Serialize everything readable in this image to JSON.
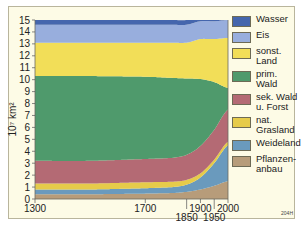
{
  "chart_data": {
    "type": "area",
    "stacked": true,
    "title": "",
    "xlabel": "",
    "ylabel": "10⁷ km²",
    "ylim": [
      0,
      15
    ],
    "xlim": [
      1300,
      2000
    ],
    "yticks": [
      "0",
      "1",
      "2",
      "3",
      "4",
      "5",
      "6",
      "7",
      "8",
      "9",
      "10",
      "11",
      "12",
      "13",
      "14",
      "15"
    ],
    "xticks": [
      {
        "value": 1300,
        "label": "1300",
        "row": 0
      },
      {
        "value": 1700,
        "label": "1700",
        "row": 0
      },
      {
        "value": 1850,
        "label": "1850",
        "row": 1
      },
      {
        "value": 1900,
        "label": "1900",
        "row": 0
      },
      {
        "value": 1950,
        "label": "1950",
        "row": 1
      },
      {
        "value": 2000,
        "label": "2000",
        "row": 0
      }
    ],
    "x": [
      1300,
      1500,
      1700,
      1800,
      1850,
      1900,
      1950,
      2000
    ],
    "series": [
      {
        "name": "Pflanzenanbau",
        "color": "#b79c7a",
        "values": [
          0.4,
          0.4,
          0.45,
          0.5,
          0.6,
          0.8,
          1.1,
          1.5
        ]
      },
      {
        "name": "Weideland",
        "color": "#6a9abd",
        "values": [
          0.4,
          0.4,
          0.45,
          0.5,
          0.6,
          1.0,
          1.9,
          3.0
        ]
      },
      {
        "name": "nat. Grasland",
        "color": "#e6cb4a",
        "values": [
          0.5,
          0.5,
          0.5,
          0.45,
          0.4,
          0.35,
          0.3,
          0.3
        ]
      },
      {
        "name": "sek. Wald u. Forst",
        "color": "#b46a74",
        "values": [
          1.9,
          1.9,
          1.95,
          2.0,
          2.1,
          2.3,
          2.5,
          2.7
        ]
      },
      {
        "name": "prim. Wald",
        "color": "#4f9a6c",
        "values": [
          7.1,
          7.1,
          6.9,
          6.7,
          6.4,
          5.6,
          4.0,
          1.8
        ]
      },
      {
        "name": "sonst. Land",
        "color": "#f2de58",
        "values": [
          2.8,
          2.8,
          2.85,
          2.95,
          3.0,
          3.35,
          3.6,
          4.2
        ]
      },
      {
        "name": "Eis",
        "color": "#98aedd",
        "values": [
          1.5,
          1.5,
          1.5,
          1.5,
          1.5,
          1.5,
          1.5,
          1.5
        ]
      },
      {
        "name": "Wasser",
        "color": "#4566ad",
        "values": [
          0.4,
          0.4,
          0.4,
          0.4,
          0.4,
          0.4,
          0.4,
          0.4
        ]
      }
    ],
    "legend_position": "right",
    "grid": false,
    "annotation": "204H"
  },
  "legend": {
    "items": [
      {
        "label": "Wasser",
        "color": "#4566ad"
      },
      {
        "label": "Eis",
        "color": "#98aedd"
      },
      {
        "label": "sonst.\nLand",
        "color": "#f2de58"
      },
      {
        "label": "prim.\nWald",
        "color": "#4f9a6c"
      },
      {
        "label": "sek. Wald\nu. Forst",
        "color": "#b46a74"
      },
      {
        "label": "nat.\nGrasland",
        "color": "#e6cb4a"
      },
      {
        "label": "Weideland",
        "color": "#6a9abd"
      },
      {
        "label": "Pflanzen-\nanbau",
        "color": "#b79c7a"
      }
    ]
  },
  "code": "204H"
}
